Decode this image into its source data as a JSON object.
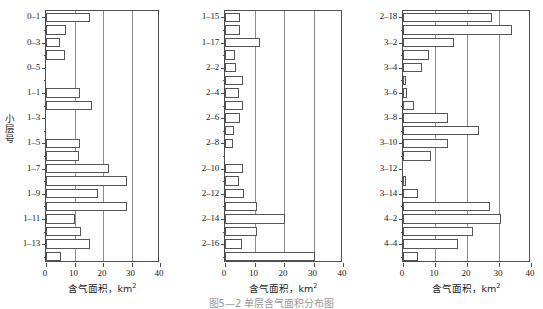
{
  "figure": {
    "caption": "图5—2  单层含气面积分布图",
    "panel_count": 3
  },
  "axis": {
    "xlabel": "含气面积，km",
    "xlabel_unit_sup": "2",
    "ylabel": "小层号",
    "xticks": [
      "0",
      "10",
      "20",
      "30",
      "40"
    ],
    "xlim": [
      0,
      40
    ],
    "gridlines": [
      10,
      20,
      30
    ]
  },
  "chart_data": [
    {
      "type": "bar",
      "orientation": "horizontal",
      "title": "",
      "xlabel": "含气面积，km²",
      "ylabel": "小层号",
      "xlim": [
        0,
        40
      ],
      "grid": true,
      "tick_labels": [
        "0-1",
        "0-3",
        "0-5",
        "1-1",
        "1-3",
        "1-5",
        "1-7",
        "1-9",
        "1-11",
        "1-13"
      ],
      "categories": [
        "0-1",
        "0-2",
        "0-3",
        "0-4",
        "0-5",
        "0-6",
        "1-1",
        "1-2",
        "1-3",
        "1-4",
        "1-5",
        "1-6",
        "1-7",
        "1-8",
        "1-9",
        "1-10",
        "1-11",
        "1-12",
        "1-13",
        "1-14"
      ],
      "values": [
        15.5,
        7.0,
        5.0,
        6.5,
        0,
        0,
        12.0,
        16.2,
        0,
        0,
        11.8,
        11.5,
        22.0,
        28.5,
        18.3,
        28.5,
        10.3,
        12.3,
        15.3,
        5.2
      ]
    },
    {
      "type": "bar",
      "orientation": "horizontal",
      "title": "",
      "xlabel": "含气面积，km²",
      "ylabel": "",
      "xlim": [
        0,
        40
      ],
      "grid": true,
      "tick_labels": [
        "1-15",
        "1-17",
        "2-2",
        "2-4",
        "2-6",
        "2-8",
        "2-10",
        "2-12",
        "2-14",
        "2-16"
      ],
      "categories": [
        "1-15",
        "1-16",
        "1-17",
        "1-18",
        "2-2",
        "2-3",
        "2-4",
        "2-5",
        "2-6",
        "2-7",
        "2-8",
        "2-9",
        "2-10",
        "2-11",
        "2-12",
        "2-13",
        "2-14",
        "2-15",
        "2-16",
        "2-17"
      ],
      "values": [
        5.0,
        5.0,
        11.7,
        3.3,
        3.8,
        6.0,
        4.8,
        6.0,
        5.0,
        3.2,
        2.8,
        0,
        6.0,
        4.8,
        6.3,
        10.7,
        20.2,
        10.7,
        5.8,
        30.4
      ]
    },
    {
      "type": "bar",
      "orientation": "horizontal",
      "title": "",
      "xlabel": "含气面积，km²",
      "ylabel": "",
      "xlim": [
        0,
        40
      ],
      "grid": true,
      "tick_labels": [
        "2-18",
        "3-2",
        "3-4",
        "3-6",
        "3-8",
        "3-10",
        "3-12",
        "3-14",
        "4-2",
        "4-4"
      ],
      "categories": [
        "2-18",
        "3-1",
        "3-2",
        "3-3",
        "3-4",
        "3-5",
        "3-6",
        "3-7",
        "3-8",
        "3-9",
        "3-10",
        "3-11",
        "3-12",
        "3-13",
        "3-14",
        "4-1",
        "4-2",
        "4-3",
        "4-4",
        "4-5"
      ],
      "values": [
        27.8,
        34.0,
        15.8,
        8.0,
        5.8,
        1.0,
        1.3,
        3.3,
        14.2,
        23.8,
        14.2,
        8.6,
        0,
        1.0,
        4.8,
        27.2,
        30.5,
        21.8,
        17.3,
        4.8
      ]
    }
  ]
}
